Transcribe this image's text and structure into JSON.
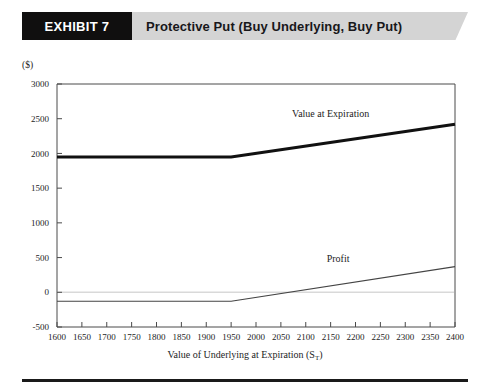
{
  "header": {
    "exhibit_tag": "EXHIBIT 7",
    "title": "Protective Put (Buy Underlying, Buy Put)",
    "tag_bg": "#100f0f",
    "band_bg": "#d4d4d4"
  },
  "chart_data": {
    "type": "line",
    "title": "Protective Put (Buy Underlying, Buy Put)",
    "xlabel": "Value of Underlying at Expiration (S",
    "xlabel_subscript": "T",
    "xlabel_suffix": ")",
    "ylabel": "($)",
    "xlim": [
      1600,
      2400
    ],
    "ylim": [
      -500,
      3000
    ],
    "xticks": [
      1600,
      1650,
      1700,
      1750,
      1800,
      1850,
      1900,
      1950,
      2000,
      2050,
      2100,
      2150,
      2200,
      2250,
      2300,
      2350,
      2400
    ],
    "yticks": [
      -500,
      0,
      500,
      1000,
      1500,
      2000,
      2500,
      3000
    ],
    "grid": false,
    "zero_gridline": true,
    "legend_position": "inline-annotation",
    "strike": 1950,
    "series": [
      {
        "name": "Value  at Expiration",
        "color": "#111111",
        "width": 3,
        "label_x": 2150,
        "label_y": 2530,
        "x": [
          1600,
          1950,
          2400
        ],
        "values": [
          1950,
          1950,
          2420
        ]
      },
      {
        "name": "Profit",
        "color": "#444444",
        "width": 1.1,
        "label_x": 2165,
        "label_y": 430,
        "x": [
          1600,
          1950,
          2400
        ],
        "values": [
          -130,
          -130,
          370
        ]
      }
    ]
  }
}
